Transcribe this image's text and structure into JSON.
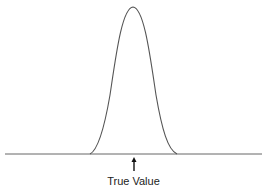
{
  "diagram": {
    "type": "distribution-curve",
    "curve": {
      "center_x": 133,
      "peak_y": 7,
      "left_x": 90,
      "right_x": 177,
      "color": "#555555"
    },
    "baseline": {
      "y": 154,
      "x_start": 5,
      "x_end": 262,
      "color": "#666666"
    },
    "arrow": {
      "x": 134,
      "y_top": 157,
      "y_bottom": 171,
      "color": "#111111"
    },
    "annotation": "True Value"
  }
}
